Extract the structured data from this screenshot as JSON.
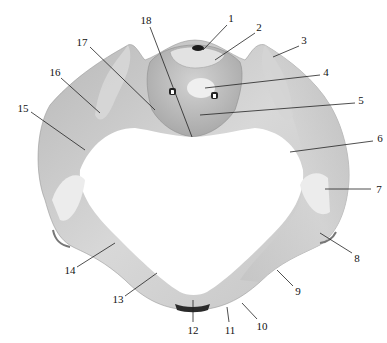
{
  "figure": {
    "colors": {
      "bone_light": "#e6e6e6",
      "bone_mid": "#c9c9c9",
      "bone_dark": "#9d9d9d",
      "background": "#ffffff",
      "line": "#222222"
    },
    "labels": [
      {
        "id": "1",
        "text": "1",
        "x": 231,
        "y": 18,
        "line": [
          227,
          25,
          203,
          50
        ]
      },
      {
        "id": "2",
        "text": "2",
        "x": 259,
        "y": 27,
        "line": [
          255,
          33,
          215,
          60
        ]
      },
      {
        "id": "3",
        "text": "3",
        "x": 304,
        "y": 40,
        "line": [
          299,
          46,
          273,
          57
        ]
      },
      {
        "id": "4",
        "text": "4",
        "x": 326,
        "y": 72,
        "line": [
          320,
          75,
          205,
          88
        ]
      },
      {
        "id": "5",
        "text": "5",
        "x": 361,
        "y": 100,
        "line": [
          355,
          103,
          200,
          115
        ]
      },
      {
        "id": "6",
        "text": "6",
        "x": 380,
        "y": 138,
        "line": [
          373,
          141,
          290,
          152
        ]
      },
      {
        "id": "7",
        "text": "7",
        "x": 379,
        "y": 189,
        "line": [
          371,
          189,
          325,
          189
        ]
      },
      {
        "id": "8",
        "text": "8",
        "x": 357,
        "y": 258,
        "line": [
          352,
          253,
          320,
          233
        ]
      },
      {
        "id": "9",
        "text": "9",
        "x": 298,
        "y": 291,
        "line": [
          293,
          286,
          277,
          270
        ]
      },
      {
        "id": "10",
        "text": "10",
        "x": 262,
        "y": 326,
        "line": [
          257,
          319,
          242,
          303
        ]
      },
      {
        "id": "11",
        "text": "11",
        "x": 230,
        "y": 330,
        "line": [
          229,
          322,
          227,
          307
        ]
      },
      {
        "id": "12",
        "text": "12",
        "x": 193,
        "y": 330,
        "line": [
          193,
          322,
          193,
          300
        ]
      },
      {
        "id": "13",
        "text": "13",
        "x": 118,
        "y": 299,
        "line": [
          125,
          296,
          157,
          273
        ]
      },
      {
        "id": "14",
        "text": "14",
        "x": 70,
        "y": 270,
        "line": [
          77,
          267,
          115,
          243
        ]
      },
      {
        "id": "15",
        "text": "15",
        "x": 23,
        "y": 108,
        "line": [
          31,
          112,
          85,
          150
        ]
      },
      {
        "id": "16",
        "text": "16",
        "x": 55,
        "y": 72,
        "line": [
          61,
          78,
          100,
          113
        ]
      },
      {
        "id": "17",
        "text": "17",
        "x": 82,
        "y": 42,
        "line": [
          90,
          47,
          155,
          110
        ]
      },
      {
        "id": "18",
        "text": "18",
        "x": 146,
        "y": 20,
        "line": [
          150,
          27,
          192,
          137
        ]
      }
    ]
  }
}
